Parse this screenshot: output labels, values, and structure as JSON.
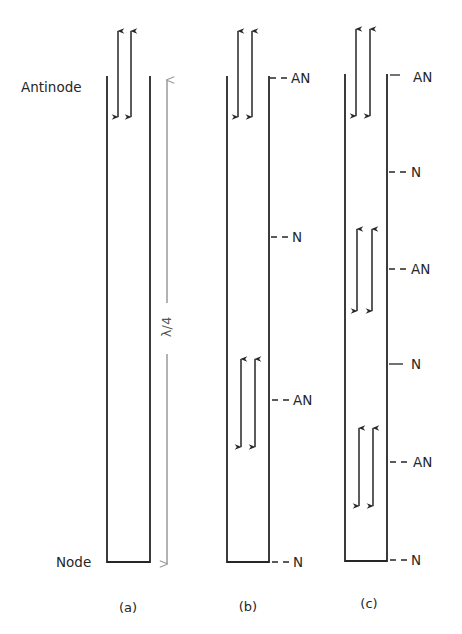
{
  "figure": {
    "side_labels": {
      "antinode": "Antinode",
      "node": "Node"
    },
    "wavelength_label": "λ/4",
    "panels": [
      {
        "caption": "(a)",
        "markers": []
      },
      {
        "caption": "(b)",
        "markers": [
          "AN",
          "N",
          "AN",
          "N"
        ]
      },
      {
        "caption": "(c)",
        "markers": [
          "AN",
          "N",
          "AN",
          "N",
          "AN",
          "N"
        ]
      }
    ],
    "colors": {
      "ink": "#262626",
      "wavelength_arrow": "#9a9a9a"
    }
  }
}
